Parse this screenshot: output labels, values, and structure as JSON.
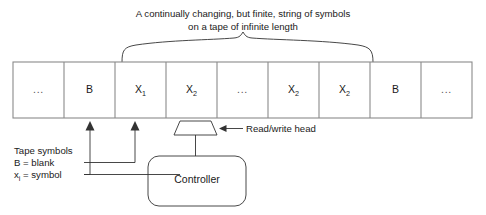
{
  "figure": {
    "title_lines": [
      "A continually changing, but finite, string of symbols",
      "on a tape of infinite length"
    ]
  },
  "tape": {
    "cells": [
      {
        "text": "...",
        "kind": "ellipsis"
      },
      {
        "text": "B",
        "kind": "symbol"
      },
      {
        "text": "X",
        "sub": "1",
        "kind": "symbol"
      },
      {
        "text": "X",
        "sub": "2",
        "kind": "symbol"
      },
      {
        "text": "...",
        "kind": "ellipsis"
      },
      {
        "text": "X",
        "sub": "2",
        "kind": "symbol"
      },
      {
        "text": "X",
        "sub": "2",
        "kind": "symbol"
      },
      {
        "text": "B",
        "kind": "symbol"
      },
      {
        "text": "...",
        "kind": "ellipsis"
      }
    ]
  },
  "annotations": {
    "tape_symbols_heading": "Tape symbols",
    "blank_definition": "B = blank",
    "symbol_definition_x": "x",
    "symbol_definition_sub": "i",
    "symbol_definition_rest": " = symbol",
    "read_write_head": "Read/write head",
    "controller": "Controller"
  },
  "colors": {
    "stroke": "#333333",
    "tape_border": "#8a8a8a",
    "background": "#ffffff",
    "text": "#1a1a1a"
  }
}
